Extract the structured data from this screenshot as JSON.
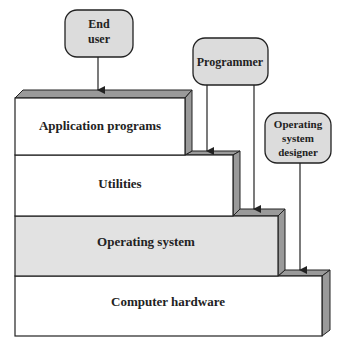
{
  "diagram": {
    "layers": [
      {
        "label": "Application programs",
        "fill": "#ffffff"
      },
      {
        "label": "Utilities",
        "fill": "#ffffff"
      },
      {
        "label": "Operating system",
        "fill": "#e2e2e2"
      },
      {
        "label": "Computer hardware",
        "fill": "#ffffff"
      }
    ],
    "actors": [
      {
        "lines": [
          "End",
          "user"
        ]
      },
      {
        "lines": [
          "Programmer"
        ]
      },
      {
        "lines": [
          "Operating",
          "system",
          "designer"
        ]
      }
    ],
    "colors": {
      "bevel": "#9a9a9a",
      "actor_fill": "#dcdcdc",
      "stroke": "#222222"
    }
  }
}
